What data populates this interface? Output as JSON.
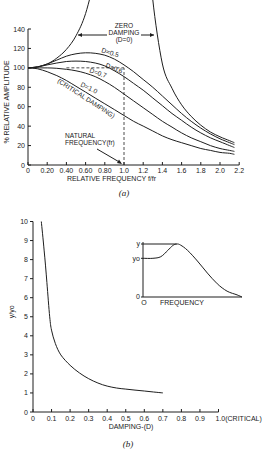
{
  "chart_data": [
    {
      "id": "a",
      "type": "line",
      "caption": "(a)",
      "title": "",
      "xlabel": "RELATIVE FREQUENCY f/fr",
      "ylabel": "% RELATIVE AMPLITUDE",
      "xlim": [
        0,
        2.2
      ],
      "ylim": [
        0,
        140
      ],
      "grid": false,
      "x_ticks": [
        0,
        0.2,
        0.4,
        0.6,
        0.8,
        1.0,
        1.2,
        1.4,
        1.6,
        1.8,
        2.0,
        2.2
      ],
      "x_tick_labels": [
        "0",
        "0.20",
        "0.40",
        "0.60",
        "0.80",
        "1.0",
        "1.2",
        "1.4",
        "1.6",
        "1.8",
        "2.0",
        "2.2"
      ],
      "y_ticks": [
        0,
        20,
        40,
        60,
        80,
        100,
        120,
        140
      ],
      "y_tick_labels": [
        "0",
        "20",
        "40",
        "60",
        "80",
        "100",
        "120",
        "140"
      ],
      "series": [
        {
          "name": "D=0 (Zero Damping)",
          "label": "ZERO DAMPING (D=0)",
          "x": [
            0,
            0.1,
            0.2,
            0.3,
            0.4,
            0.5,
            0.6,
            0.7,
            0.75
          ],
          "values": [
            100,
            101,
            104,
            110,
            119,
            133,
            156,
            196,
            230
          ],
          "x_right": [
            1.26,
            1.3,
            1.4,
            1.5,
            1.6,
            1.7,
            1.8,
            1.9,
            2.0,
            2.1,
            2.15
          ],
          "values_right": [
            230,
            170,
            104,
            79,
            62,
            50,
            41,
            34,
            29,
            25,
            23
          ]
        },
        {
          "name": "D=0.5",
          "label": "D=0.5",
          "x": [
            0,
            0.1,
            0.2,
            0.3,
            0.4,
            0.5,
            0.6,
            0.7,
            0.8,
            0.9,
            1.0,
            1.1,
            1.2,
            1.3,
            1.4,
            1.5,
            1.6,
            1.7,
            1.8,
            1.9,
            2.0,
            2.1,
            2.15
          ],
          "values": [
            100,
            101,
            104,
            108,
            112,
            114.5,
            115.5,
            115,
            113,
            109,
            103,
            96,
            88,
            80,
            71,
            62,
            53,
            45,
            38,
            32,
            27,
            23,
            21
          ]
        },
        {
          "name": "D=0.6",
          "label": "D=0.6",
          "x": [
            0,
            0.1,
            0.2,
            0.3,
            0.4,
            0.5,
            0.6,
            0.7,
            0.8,
            0.9,
            1.0,
            1.1,
            1.2,
            1.3,
            1.4,
            1.5,
            1.6,
            1.7,
            1.8,
            1.9,
            2.0,
            2.1,
            2.15
          ],
          "values": [
            100,
            101,
            103,
            105,
            106.5,
            107,
            106.5,
            105,
            102,
            97,
            91,
            84,
            77,
            69,
            61,
            53,
            46,
            39,
            33,
            28,
            24,
            20,
            18
          ]
        },
        {
          "name": "D=0.7",
          "label": "D=0.7",
          "x": [
            0,
            0.1,
            0.2,
            0.3,
            0.4,
            0.5,
            0.6,
            0.7,
            0.8,
            0.9,
            1.0,
            1.1,
            1.2,
            1.3,
            1.4,
            1.5,
            1.6,
            1.7,
            1.8,
            1.9,
            2.0,
            2.1,
            2.15
          ],
          "values": [
            100,
            100,
            100,
            99.5,
            98.5,
            97,
            94.5,
            91,
            86,
            80,
            73,
            66,
            59,
            52,
            45,
            39,
            33,
            28,
            24,
            20,
            17,
            15,
            14
          ]
        },
        {
          "name": "D=1.0 (Critical Damping)",
          "label": "D=1.0 (CRITICAL DAMPING)",
          "x": [
            0,
            0.1,
            0.2,
            0.3,
            0.4,
            0.5,
            0.6,
            0.7,
            0.8,
            0.9,
            1.0,
            1.1,
            1.2,
            1.3,
            1.4,
            1.5,
            1.6,
            1.7,
            1.8,
            1.9,
            2.0,
            2.1,
            2.15
          ],
          "values": [
            100,
            99,
            96,
            92,
            87,
            81,
            75,
            69,
            63,
            57,
            51,
            45,
            40,
            35,
            30,
            26,
            23,
            20,
            17,
            15,
            13,
            12,
            11
          ]
        }
      ],
      "annotations": [
        {
          "text": "ZERO",
          "x": 0.99,
          "y": 148
        },
        {
          "text": "DAMPING",
          "x": 0.99,
          "y": 141
        },
        {
          "text": "(D=0)",
          "x": 0.99,
          "y": 134
        },
        {
          "text": "D=0.5",
          "x": 0.8,
          "y": 117
        },
        {
          "text": "D=0.6",
          "x": 0.92,
          "y": 101
        },
        {
          "text": "D=0.7",
          "x": 0.68,
          "y": 95
        },
        {
          "text": "D=1.0",
          "x": 0.62,
          "y": 80
        },
        {
          "text": "(CRITICAL DAMPING)",
          "x": 0.32,
          "y": 82
        },
        {
          "text": "NATURAL",
          "x": 0.4,
          "y": 32
        },
        {
          "text": "FREQUENCY(fr)",
          "x": 0.4,
          "y": 24
        }
      ],
      "reference_lines": [
        {
          "type": "horizontal-dashed",
          "y": 100,
          "x_from": 0.4,
          "x_to": 1.0
        },
        {
          "type": "vertical-dashed",
          "x": 1.0,
          "y_from": 0,
          "y_to": 100
        }
      ]
    },
    {
      "id": "b",
      "type": "line",
      "caption": "(b)",
      "title": "",
      "xlabel": "DAMPING-(D)",
      "ylabel": "y/yo",
      "xlim": [
        0,
        1.0
      ],
      "ylim": [
        0,
        10
      ],
      "grid": false,
      "x_ticks": [
        0,
        0.1,
        0.2,
        0.3,
        0.4,
        0.5,
        0.6,
        0.7,
        0.8,
        0.9,
        1.0
      ],
      "x_tick_labels": [
        "0",
        "0.1",
        "0.2",
        "0.3",
        "0.4",
        "0.5",
        "0.6",
        "0.7",
        "0.8",
        "0.9",
        "1.0(CRITICAL)"
      ],
      "y_ticks": [
        0,
        1,
        2,
        3,
        4,
        5,
        6,
        7,
        8,
        9,
        10
      ],
      "y_tick_labels": [
        "0",
        "1",
        "2",
        "3",
        "4",
        "5",
        "6",
        "7",
        "8",
        "9",
        "10"
      ],
      "series": [
        {
          "name": "y/yo vs damping",
          "x": [
            0.045,
            0.06,
            0.075,
            0.09,
            0.1,
            0.12,
            0.15,
            0.2,
            0.25,
            0.3,
            0.35,
            0.4,
            0.45,
            0.5,
            0.55,
            0.6,
            0.65,
            0.7
          ],
          "values": [
            10,
            8.5,
            6.8,
            5.0,
            4.3,
            3.6,
            3.0,
            2.45,
            2.05,
            1.75,
            1.52,
            1.36,
            1.26,
            1.2,
            1.15,
            1.1,
            1.05,
            1.0
          ]
        }
      ],
      "inset": {
        "xlabel": "FREQUENCY",
        "x_origin_label": "O",
        "y_tick_labels": [
          "y",
          "yo",
          "0"
        ],
        "curve_points": [
          [
            0,
            0.73
          ],
          [
            0.1,
            0.73
          ],
          [
            0.18,
            0.76
          ],
          [
            0.25,
            0.88
          ],
          [
            0.3,
            0.97
          ],
          [
            0.34,
            1.0
          ],
          [
            0.38,
            0.98
          ],
          [
            0.45,
            0.88
          ],
          [
            0.55,
            0.68
          ],
          [
            0.65,
            0.45
          ],
          [
            0.75,
            0.25
          ],
          [
            0.85,
            0.11
          ],
          [
            0.95,
            0.04
          ],
          [
            1.0,
            0.0
          ]
        ],
        "reference_line": {
          "type": "horizontal",
          "level": "y",
          "x_from": 0,
          "x_to": 0.34
        }
      }
    }
  ]
}
